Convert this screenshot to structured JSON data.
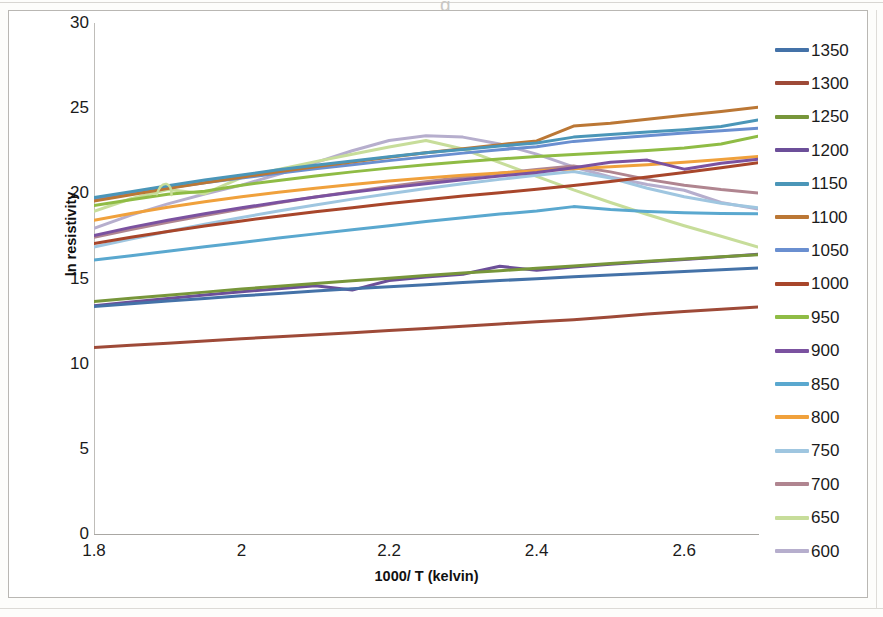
{
  "chart_data": {
    "type": "line",
    "title": "",
    "xlabel": "1000/ T (kelvin)",
    "ylabel": "ln resistivity",
    "xlim": [
      1.8,
      2.7
    ],
    "ylim": [
      0,
      30
    ],
    "xticks": [
      "1.8",
      "2",
      "2.2",
      "2.4",
      "2.6"
    ],
    "xtick_values": [
      1.8,
      2.0,
      2.2,
      2.4,
      2.6
    ],
    "yticks": [
      "0",
      "5",
      "10",
      "15",
      "20",
      "25",
      "30"
    ],
    "ytick_values": [
      0,
      5,
      10,
      15,
      20,
      25,
      30
    ],
    "grid": false,
    "legend_position": "right",
    "x": [
      1.8,
      1.85,
      1.9,
      1.95,
      2.0,
      2.05,
      2.1,
      2.15,
      2.2,
      2.25,
      2.3,
      2.35,
      2.4,
      2.45,
      2.5,
      2.55,
      2.6,
      2.65,
      2.7
    ],
    "series": [
      {
        "name": "1350",
        "color": "#4472a8",
        "values": [
          13.35,
          13.52,
          13.68,
          13.83,
          13.98,
          14.12,
          14.26,
          14.4,
          14.52,
          14.64,
          14.76,
          14.88,
          14.99,
          15.1,
          15.21,
          15.31,
          15.41,
          15.51,
          15.62
        ]
      },
      {
        "name": "1300",
        "color": "#9e4a38",
        "values": [
          10.95,
          11.08,
          11.2,
          11.33,
          11.46,
          11.58,
          11.7,
          11.82,
          11.94,
          12.07,
          12.2,
          12.33,
          12.46,
          12.58,
          12.74,
          12.91,
          13.06,
          13.2,
          13.33
        ]
      },
      {
        "name": "1250",
        "color": "#77963a",
        "values": [
          13.65,
          13.84,
          14.02,
          14.2,
          14.38,
          14.55,
          14.71,
          14.87,
          15.02,
          15.17,
          15.32,
          15.46,
          15.6,
          15.74,
          15.88,
          16.01,
          16.14,
          16.27,
          16.4
        ]
      },
      {
        "name": "1200",
        "color": "#6c4f99",
        "values": [
          13.4,
          13.62,
          13.83,
          14.03,
          14.22,
          14.4,
          14.57,
          14.32,
          14.88,
          15.09,
          15.25,
          15.72,
          15.48,
          15.67,
          15.83,
          15.98,
          16.12,
          16.26,
          16.42
        ]
      },
      {
        "name": "1150",
        "color": "#4b96b8",
        "values": [
          19.75,
          20.1,
          20.45,
          20.78,
          21.08,
          21.38,
          21.65,
          21.9,
          22.15,
          22.38,
          22.58,
          22.78,
          22.96,
          23.3,
          23.46,
          23.6,
          23.74,
          23.92,
          24.3
        ]
      },
      {
        "name": "1100",
        "color": "#bb7735",
        "values": [
          19.55,
          19.92,
          20.28,
          20.62,
          20.95,
          21.26,
          21.56,
          21.84,
          22.12,
          22.38,
          22.62,
          22.86,
          23.08,
          23.95,
          24.12,
          24.35,
          24.58,
          24.8,
          25.05
        ]
      },
      {
        "name": "1050",
        "color": "#6a8fd0",
        "values": [
          19.68,
          20.0,
          20.32,
          20.62,
          20.9,
          21.18,
          21.44,
          21.68,
          21.92,
          22.14,
          22.36,
          22.56,
          22.74,
          23.05,
          23.22,
          23.38,
          23.54,
          23.68,
          23.82
        ]
      },
      {
        "name": "1000",
        "color": "#a8462b"
      },
      {
        "name": "950",
        "color": "#8fbc45",
        "values": [
          19.28,
          19.62,
          19.95,
          20.12,
          20.48,
          20.76,
          21.02,
          21.26,
          21.48,
          21.68,
          21.86,
          22.02,
          22.16,
          22.28,
          22.4,
          22.52,
          22.66,
          22.9,
          23.35
        ]
      },
      {
        "name": "900",
        "color": "#7b52a0",
        "values": [
          17.52,
          18.0,
          18.42,
          18.8,
          19.15,
          19.48,
          19.78,
          20.06,
          20.32,
          20.56,
          20.8,
          21.02,
          21.22,
          21.5,
          21.82,
          21.95,
          21.42,
          21.76,
          22.0
        ]
      },
      {
        "name": "850",
        "color": "#5aa8cf"
      },
      {
        "name": "800",
        "color": "#f0a13c",
        "values": [
          18.42,
          18.82,
          19.18,
          19.5,
          19.8,
          20.06,
          20.3,
          20.52,
          20.72,
          20.9,
          21.06,
          21.2,
          21.32,
          21.44,
          21.56,
          21.68,
          21.82,
          21.98,
          22.16
        ]
      },
      {
        "name": "750",
        "color": "#9fc6e0"
      },
      {
        "name": "700",
        "color": "#b08590"
      },
      {
        "name": "650",
        "color": "#c7dd9a"
      },
      {
        "name": "600",
        "color": "#b6aecd"
      }
    ]
  },
  "legend": {
    "entries": [
      {
        "label": "1350",
        "color": "#4472a8"
      },
      {
        "label": "1300",
        "color": "#9e4a38"
      },
      {
        "label": "1250",
        "color": "#77963a"
      },
      {
        "label": "1200",
        "color": "#6c4f99"
      },
      {
        "label": "1150",
        "color": "#4b96b8"
      },
      {
        "label": "1100",
        "color": "#bb7735"
      },
      {
        "label": "1050",
        "color": "#6a8fd0"
      },
      {
        "label": "1000",
        "color": "#a8462b"
      },
      {
        "label": "950",
        "color": "#8fbc45"
      },
      {
        "label": "900",
        "color": "#7b52a0"
      },
      {
        "label": "850",
        "color": "#5aa8cf"
      },
      {
        "label": "800",
        "color": "#f0a13c"
      },
      {
        "label": "750",
        "color": "#9fc6e0"
      },
      {
        "label": "700",
        "color": "#b08590"
      },
      {
        "label": "650",
        "color": "#c7dd9a"
      },
      {
        "label": "600",
        "color": "#b6aecd"
      }
    ]
  },
  "scan": {
    "ghost_text": "g"
  }
}
